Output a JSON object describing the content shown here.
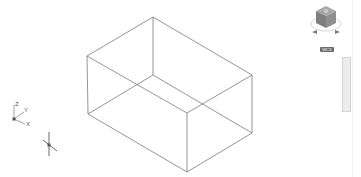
{
  "viewport": {
    "background": "#ffffff",
    "wire_color": "#7a7a7a"
  },
  "model": {
    "type": "wireframe-box",
    "vertices": {
      "top_back": [
        153,
        17
      ],
      "left_top": [
        87,
        56
      ],
      "right_top": [
        252,
        75
      ],
      "front_top": [
        187,
        113
      ],
      "back_bottom": [
        153,
        75
      ],
      "left_bottom": [
        88,
        114
      ],
      "right_bottom": [
        252,
        133
      ],
      "front_bottom": [
        187,
        172
      ]
    }
  },
  "ucs_icon": {
    "x_label": "X",
    "y_label": "Y",
    "z_label": "Z"
  },
  "viewcube": {
    "label": "WCS"
  },
  "navigation_bar": {
    "visible": true
  },
  "cursor": {
    "type": "crosshair",
    "position": [
      49,
      145
    ]
  }
}
